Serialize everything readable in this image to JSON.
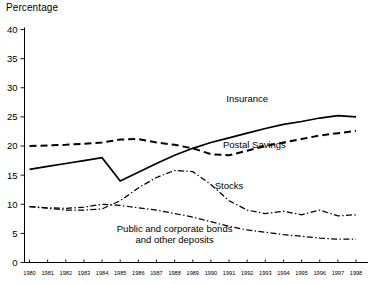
{
  "axis_title": "Percentage",
  "ghost_top_text": "",
  "chart_data": {
    "type": "line",
    "title": "",
    "subtitle": "",
    "xlabel": "",
    "ylabel": "Percentage",
    "ylim": [
      0,
      40
    ],
    "ytick_values": [
      0,
      5,
      10,
      15,
      20,
      25,
      30,
      35,
      40
    ],
    "ytick_labels": [
      "0",
      "5",
      "10",
      "15",
      "20",
      "25",
      "30",
      "35",
      "40"
    ],
    "grid": false,
    "legend_position": "inline-annotations",
    "x": [
      1980,
      1981,
      1982,
      1983,
      1984,
      1985,
      1986,
      1987,
      1988,
      1989,
      1990,
      1991,
      1992,
      1993,
      1994,
      1995,
      1996,
      1997,
      1998
    ],
    "xtick_labels": [
      "1980",
      "1981",
      "1982",
      "1983",
      "1984",
      "1985",
      "1986",
      "1987",
      "1988",
      "1989",
      "1990",
      "1991",
      "1992",
      "1993",
      "1994",
      "1995",
      "1996",
      "1997",
      "1998"
    ],
    "series": [
      {
        "name": "Insurance",
        "style": "solid",
        "color": "#000000",
        "label_text": "Insurance",
        "values": [
          16.0,
          16.5,
          17.0,
          17.5,
          18.0,
          14.0,
          15.5,
          17.0,
          18.4,
          19.6,
          20.6,
          21.4,
          22.2,
          23.0,
          23.7,
          24.2,
          24.8,
          25.2,
          25.0
        ]
      },
      {
        "name": "Postal Savings",
        "style": "dashed",
        "color": "#000000",
        "label_text": "Postal Savings",
        "values": [
          20.0,
          20.1,
          20.2,
          20.4,
          20.6,
          21.1,
          21.2,
          20.6,
          20.2,
          19.6,
          18.6,
          18.4,
          19.2,
          20.0,
          20.6,
          21.2,
          21.8,
          22.2,
          22.6
        ]
      },
      {
        "name": "Stocks",
        "style": "dash-dot",
        "color": "#000000",
        "label_text": "Stocks",
        "values": [
          9.6,
          9.3,
          9.0,
          9.0,
          9.2,
          10.6,
          12.8,
          14.6,
          15.8,
          15.6,
          13.4,
          10.6,
          9.0,
          8.4,
          8.8,
          8.2,
          9.0,
          8.0,
          8.2
        ]
      },
      {
        "name": "Public and corporate bonds and other deposits",
        "style": "dash-dot",
        "color": "#000000",
        "label_text": "Public and corporate bonds\nand other deposits",
        "label_line1": "Public and corporate bonds",
        "label_line2": "and other deposits",
        "values": [
          9.6,
          9.4,
          9.3,
          9.5,
          10.0,
          9.8,
          9.4,
          9.0,
          8.4,
          7.8,
          7.0,
          6.2,
          5.6,
          5.2,
          4.8,
          4.5,
          4.2,
          4.0,
          4.0
        ]
      }
    ],
    "annotations": [
      {
        "text": "Insurance",
        "x": 1992.0,
        "y": 27.5
      },
      {
        "text": "Postal Savings",
        "x": 1992.4,
        "y": 19.6
      },
      {
        "text": "Stocks",
        "x": 1991.0,
        "y": 12.6
      },
      {
        "text": "Public and corporate bonds",
        "x": 1988.0,
        "y": 5.2
      },
      {
        "text": "and other deposits",
        "x": 1988.0,
        "y": 3.3
      }
    ]
  }
}
